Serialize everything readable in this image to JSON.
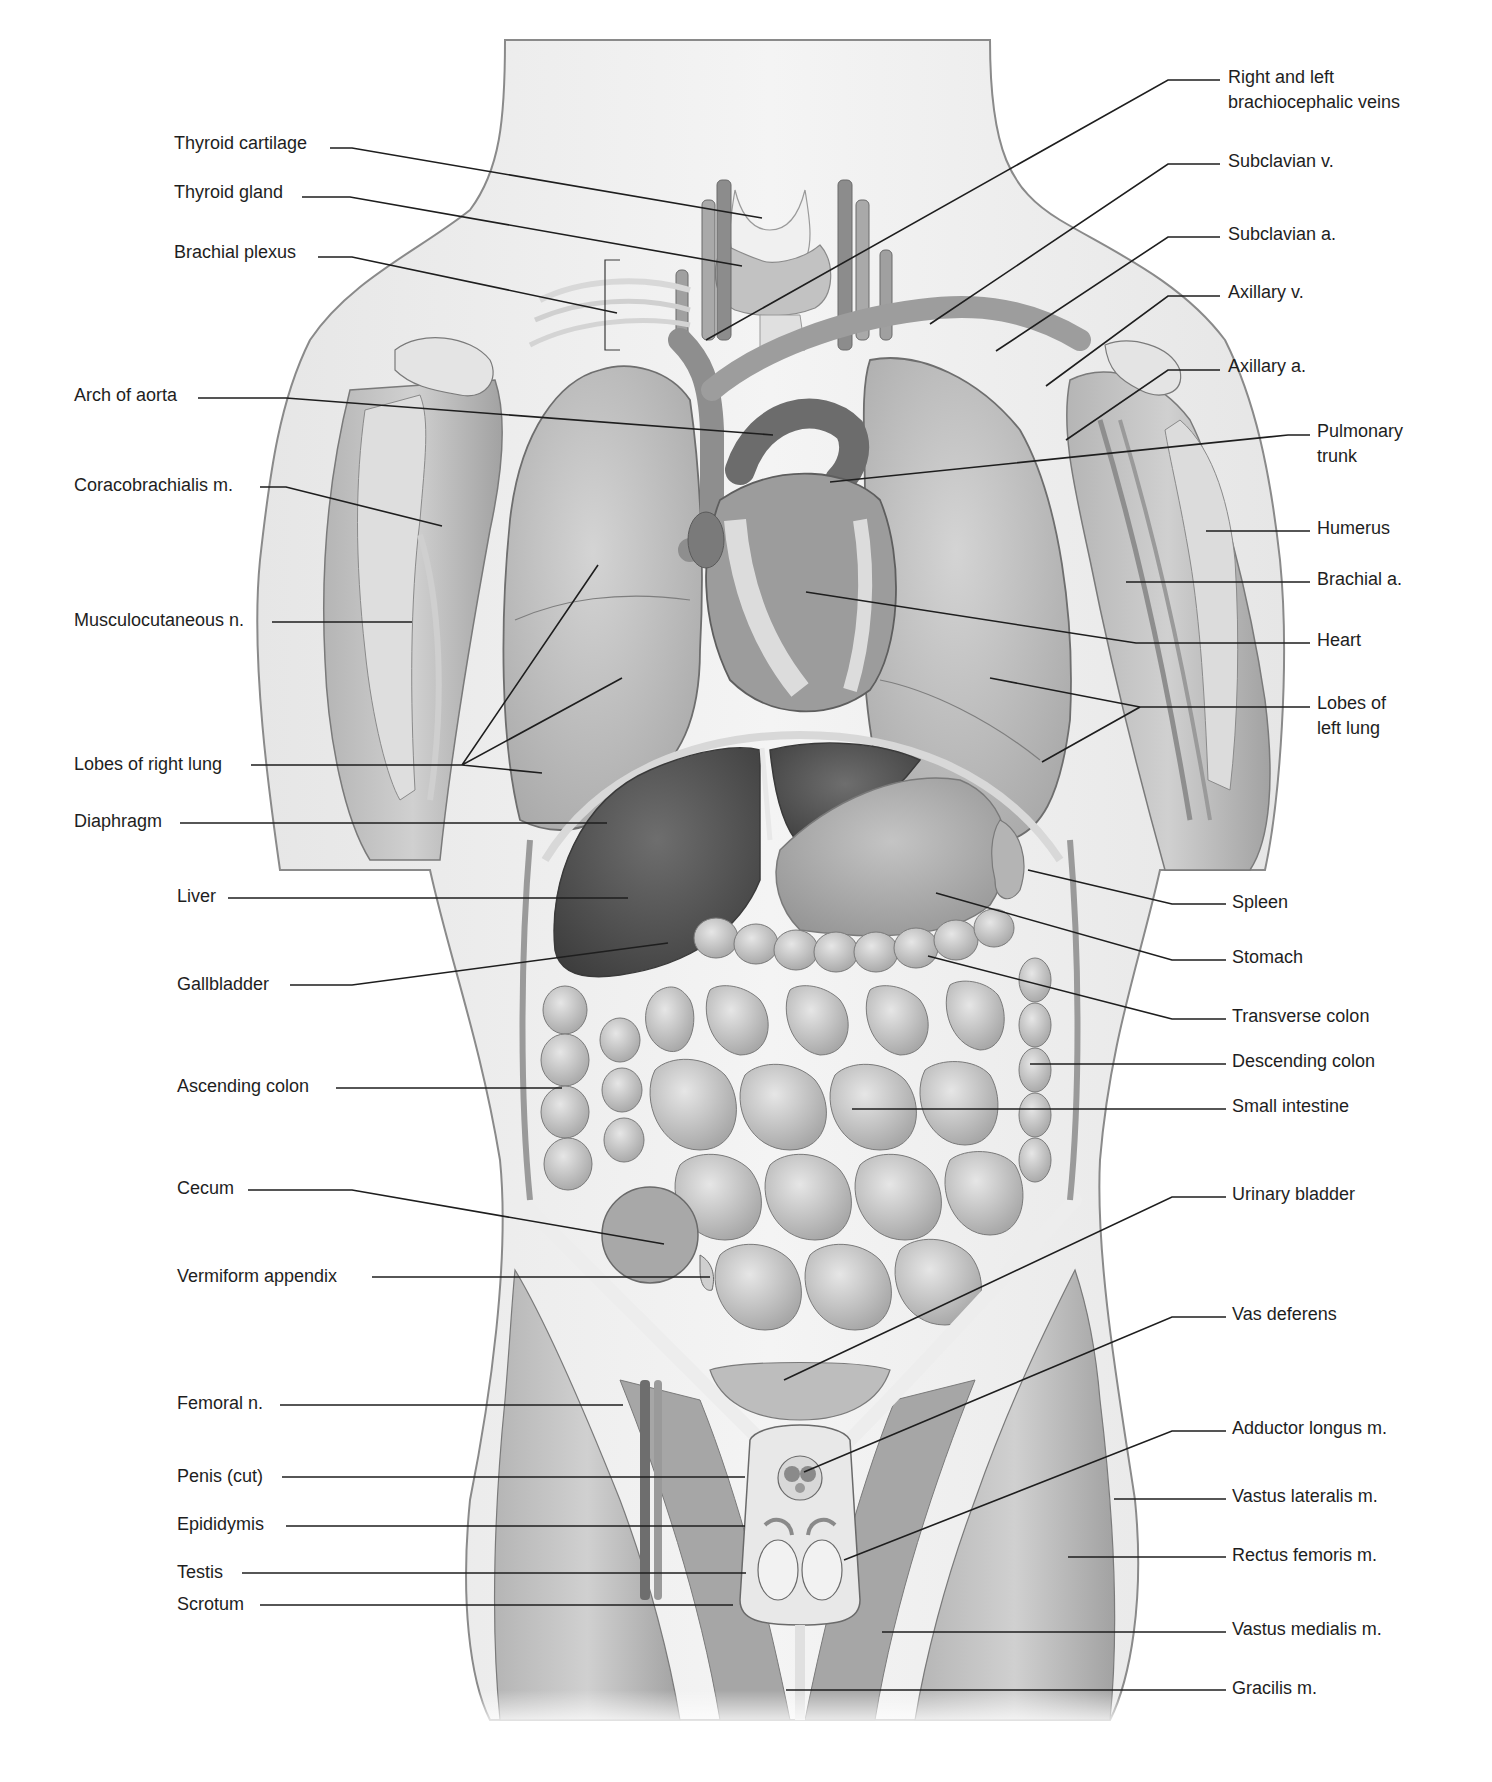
{
  "figure": {
    "type": "anatomical-illustration",
    "view": "anterior",
    "palette": {
      "line": "#1e1e1e",
      "skin": "#efefef",
      "organ": "#bdbdbd",
      "dark_organ": "#5a5a5a",
      "muscle": "#a8a8a8",
      "bg": "#ffffff"
    }
  },
  "labels_left": [
    {
      "id": "thyroid-cartilage",
      "text": "Thyroid cartilage",
      "x": 174,
      "y": 135,
      "line": [
        [
          330,
          148
        ],
        [
          352,
          148
        ],
        [
          762,
          218
        ]
      ]
    },
    {
      "id": "thyroid-gland",
      "text": "Thyroid gland",
      "x": 174,
      "y": 184,
      "line": [
        [
          302,
          197
        ],
        [
          350,
          197
        ],
        [
          742,
          266
        ]
      ]
    },
    {
      "id": "brachial-plexus",
      "text": "Brachial plexus",
      "x": 174,
      "y": 244,
      "line": [
        [
          318,
          257
        ],
        [
          352,
          257
        ],
        [
          617,
          313
        ]
      ]
    },
    {
      "id": "arch-of-aorta",
      "text": "Arch of aorta",
      "x": 74,
      "y": 387,
      "line": [
        [
          198,
          398
        ],
        [
          286,
          398
        ],
        [
          773,
          435
        ]
      ]
    },
    {
      "id": "coracobrachialis",
      "text": "Coracobrachialis m.",
      "x": 74,
      "y": 477,
      "line": [
        [
          260,
          487
        ],
        [
          286,
          487
        ],
        [
          442,
          526
        ]
      ]
    },
    {
      "id": "musculocutaneous",
      "text": "Musculocutaneous n.",
      "x": 74,
      "y": 612,
      "line": [
        [
          272,
          622
        ],
        [
          412,
          622
        ]
      ]
    },
    {
      "id": "lobes-right-lung",
      "text": "Lobes of right lung",
      "x": 74,
      "y": 756,
      "line": [
        [
          251,
          765
        ],
        [
          462,
          765
        ],
        [
          598,
          565
        ],
        [
          462,
          765
        ],
        [
          622,
          678
        ],
        [
          462,
          765
        ],
        [
          542,
          773
        ]
      ]
    },
    {
      "id": "diaphragm",
      "text": "Diaphragm",
      "x": 74,
      "y": 813,
      "line": [
        [
          180,
          823
        ],
        [
          607,
          823
        ]
      ]
    },
    {
      "id": "liver",
      "text": "Liver",
      "x": 177,
      "y": 888,
      "line": [
        [
          228,
          898
        ],
        [
          628,
          898
        ]
      ]
    },
    {
      "id": "gallbladder",
      "text": "Gallbladder",
      "x": 177,
      "y": 976,
      "line": [
        [
          290,
          985
        ],
        [
          352,
          985
        ],
        [
          668,
          943
        ]
      ]
    },
    {
      "id": "ascending-colon",
      "text": "Ascending colon",
      "x": 177,
      "y": 1078,
      "line": [
        [
          336,
          1088
        ],
        [
          562,
          1088
        ]
      ]
    },
    {
      "id": "cecum",
      "text": "Cecum",
      "x": 177,
      "y": 1180,
      "line": [
        [
          248,
          1190
        ],
        [
          352,
          1190
        ],
        [
          664,
          1244
        ]
      ]
    },
    {
      "id": "vermiform-appendix",
      "text": "Vermiform appendix",
      "x": 177,
      "y": 1268,
      "line": [
        [
          372,
          1277
        ],
        [
          710,
          1277
        ]
      ]
    },
    {
      "id": "femoral-n",
      "text": "Femoral n.",
      "x": 177,
      "y": 1395,
      "line": [
        [
          280,
          1405
        ],
        [
          623,
          1405
        ]
      ]
    },
    {
      "id": "penis-cut",
      "text": "Penis (cut)",
      "x": 177,
      "y": 1468,
      "line": [
        [
          282,
          1477
        ],
        [
          745,
          1477
        ]
      ]
    },
    {
      "id": "epididymis",
      "text": "Epididymis",
      "x": 177,
      "y": 1516,
      "line": [
        [
          286,
          1526
        ],
        [
          745,
          1526
        ]
      ]
    },
    {
      "id": "testis",
      "text": "Testis",
      "x": 177,
      "y": 1564,
      "line": [
        [
          242,
          1573
        ],
        [
          746,
          1573
        ]
      ]
    },
    {
      "id": "scrotum",
      "text": "Scrotum",
      "x": 177,
      "y": 1596,
      "line": [
        [
          260,
          1605
        ],
        [
          733,
          1605
        ]
      ]
    }
  ],
  "labels_right": [
    {
      "id": "brachiocephalic-veins",
      "text": "Right and left\nbrachiocephalic veins",
      "x": 1228,
      "y": 69,
      "line": [
        [
          1220,
          80
        ],
        [
          1168,
          80
        ],
        [
          706,
          340
        ]
      ]
    },
    {
      "id": "subclavian-v",
      "text": "Subclavian v.",
      "x": 1228,
      "y": 153,
      "line": [
        [
          1220,
          164
        ],
        [
          1168,
          164
        ],
        [
          930,
          324
        ]
      ]
    },
    {
      "id": "subclavian-a",
      "text": "Subclavian a.",
      "x": 1228,
      "y": 226,
      "line": [
        [
          1220,
          237
        ],
        [
          1168,
          237
        ],
        [
          996,
          351
        ]
      ]
    },
    {
      "id": "axillary-v",
      "text": "Axillary v.",
      "x": 1228,
      "y": 284,
      "line": [
        [
          1220,
          296
        ],
        [
          1168,
          296
        ],
        [
          1046,
          386
        ]
      ]
    },
    {
      "id": "axillary-a",
      "text": "Axillary a.",
      "x": 1228,
      "y": 358,
      "line": [
        [
          1220,
          370
        ],
        [
          1168,
          370
        ],
        [
          1066,
          440
        ]
      ]
    },
    {
      "id": "pulmonary-trunk",
      "text": "Pulmonary\ntrunk",
      "x": 1317,
      "y": 423,
      "line": [
        [
          1310,
          435
        ],
        [
          1288,
          435
        ],
        [
          830,
          482
        ]
      ]
    },
    {
      "id": "humerus",
      "text": "Humerus",
      "x": 1317,
      "y": 520,
      "line": [
        [
          1310,
          531
        ],
        [
          1206,
          531
        ]
      ]
    },
    {
      "id": "brachial-a",
      "text": "Brachial a.",
      "x": 1317,
      "y": 571,
      "line": [
        [
          1310,
          582
        ],
        [
          1126,
          582
        ]
      ]
    },
    {
      "id": "heart",
      "text": "Heart",
      "x": 1317,
      "y": 632,
      "line": [
        [
          1310,
          643
        ],
        [
          1136,
          643
        ],
        [
          806,
          592
        ]
      ]
    },
    {
      "id": "lobes-left-lung",
      "text": "Lobes of\nleft lung",
      "x": 1317,
      "y": 695,
      "line": [
        [
          1310,
          707
        ],
        [
          1140,
          707
        ],
        [
          990,
          678
        ],
        [
          1140,
          707
        ],
        [
          1042,
          762
        ]
      ]
    },
    {
      "id": "spleen",
      "text": "Spleen",
      "x": 1232,
      "y": 894,
      "line": [
        [
          1226,
          904
        ],
        [
          1172,
          904
        ],
        [
          1028,
          870
        ]
      ]
    },
    {
      "id": "stomach",
      "text": "Stomach",
      "x": 1232,
      "y": 949,
      "line": [
        [
          1226,
          960
        ],
        [
          1172,
          960
        ],
        [
          936,
          893
        ]
      ]
    },
    {
      "id": "transverse-colon",
      "text": "Transverse colon",
      "x": 1232,
      "y": 1008,
      "line": [
        [
          1226,
          1019
        ],
        [
          1172,
          1019
        ],
        [
          928,
          956
        ]
      ]
    },
    {
      "id": "descending-colon",
      "text": "Descending colon",
      "x": 1232,
      "y": 1053,
      "line": [
        [
          1226,
          1064
        ],
        [
          1030,
          1064
        ]
      ]
    },
    {
      "id": "small-intestine",
      "text": "Small intestine",
      "x": 1232,
      "y": 1098,
      "line": [
        [
          1226,
          1109
        ],
        [
          852,
          1109
        ]
      ]
    },
    {
      "id": "urinary-bladder",
      "text": "Urinary bladder",
      "x": 1232,
      "y": 1186,
      "line": [
        [
          1226,
          1197
        ],
        [
          1172,
          1197
        ],
        [
          784,
          1380
        ]
      ]
    },
    {
      "id": "vas-deferens",
      "text": "Vas deferens",
      "x": 1232,
      "y": 1306,
      "line": [
        [
          1226,
          1317
        ],
        [
          1172,
          1317
        ],
        [
          804,
          1472
        ]
      ]
    },
    {
      "id": "adductor-longus",
      "text": "Adductor longus m.",
      "x": 1232,
      "y": 1420,
      "line": [
        [
          1226,
          1431
        ],
        [
          1172,
          1431
        ],
        [
          844,
          1560
        ]
      ]
    },
    {
      "id": "vastus-lateralis",
      "text": "Vastus lateralis m.",
      "x": 1232,
      "y": 1488,
      "line": [
        [
          1226,
          1499
        ],
        [
          1114,
          1499
        ]
      ]
    },
    {
      "id": "rectus-femoris",
      "text": "Rectus femoris m.",
      "x": 1232,
      "y": 1547,
      "line": [
        [
          1226,
          1557
        ],
        [
          1068,
          1557
        ]
      ]
    },
    {
      "id": "vastus-medialis",
      "text": "Vastus medialis m.",
      "x": 1232,
      "y": 1621,
      "line": [
        [
          1226,
          1632
        ],
        [
          882,
          1632
        ]
      ]
    },
    {
      "id": "gracilis",
      "text": "Gracilis m.",
      "x": 1232,
      "y": 1680,
      "line": [
        [
          1226,
          1690
        ],
        [
          786,
          1690
        ]
      ]
    }
  ]
}
